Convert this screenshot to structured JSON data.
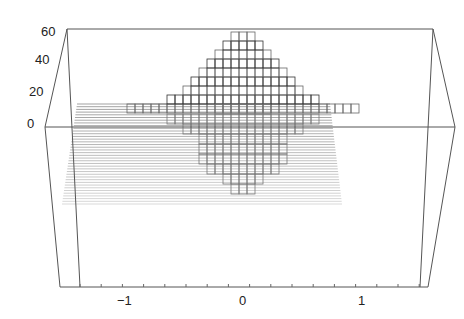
{
  "chart_data": {
    "type": "surface3d",
    "title": "",
    "xlabel": "",
    "ylabel": "",
    "zlabel": "",
    "x_ticks": [
      "-1",
      "0",
      "1"
    ],
    "z_ticks": [
      "0",
      "20",
      "40",
      "60"
    ],
    "xlim": [
      -1.5,
      1.5
    ],
    "zlim": [
      -60,
      60
    ],
    "peak_max": 55,
    "trough_min": -55
  },
  "axes": {
    "z_labels": [
      {
        "text": "60",
        "y": 32
      },
      {
        "text": "40",
        "y": 60
      },
      {
        "text": "20",
        "y": 91
      },
      {
        "text": "0",
        "y": 124
      }
    ],
    "x_labels": [
      {
        "text": "−1",
        "x": 125
      },
      {
        "text": "0",
        "x": 243
      },
      {
        "text": "1",
        "x": 362
      }
    ]
  }
}
